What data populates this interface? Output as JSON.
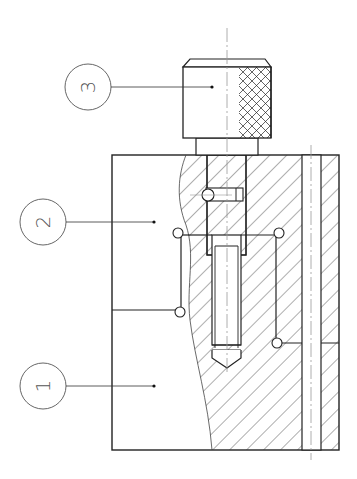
{
  "drawing": {
    "type": "technical-section-drawing",
    "line_color": "#222222",
    "centerline_color": "#999999",
    "hatch_color": "#333333"
  },
  "callouts": [
    {
      "id": "1",
      "label": "1",
      "part": "base-block"
    },
    {
      "id": "2",
      "label": "2",
      "part": "guide-plate"
    },
    {
      "id": "3",
      "label": "3",
      "part": "knurled-knob"
    }
  ]
}
